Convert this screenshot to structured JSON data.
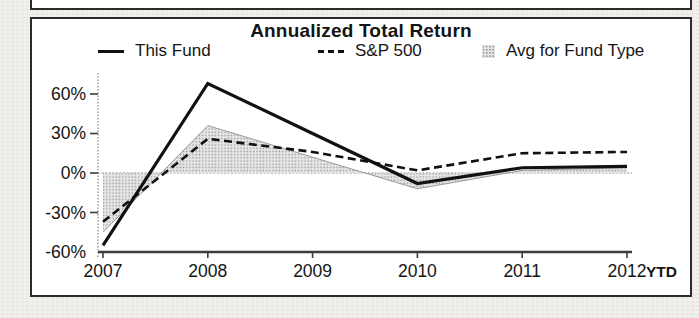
{
  "panel": {
    "title": "Annualized Total Return"
  },
  "legend": {
    "items": [
      {
        "label": "This Fund",
        "swatch": "solid-line"
      },
      {
        "label": "S&P 500",
        "swatch": "dashed-line"
      },
      {
        "label": "Avg for Fund Type",
        "swatch": "shaded-area"
      }
    ]
  },
  "chart_data": {
    "type": "line",
    "title": "Annualized Total Return",
    "categories": [
      "2007",
      "2008",
      "2009",
      "2010",
      "2011",
      "2012"
    ],
    "ytd_label": "YTD",
    "unit": "%",
    "ylim": [
      -60,
      72
    ],
    "y_ticks": [
      {
        "label": "60%",
        "value": 60
      },
      {
        "label": "30%",
        "value": 30
      },
      {
        "label": "0%",
        "value": 0
      },
      {
        "label": "-30%",
        "value": -30
      },
      {
        "label": "-60%",
        "value": -60
      }
    ],
    "grid": "zero-line-only",
    "legend_position": "top",
    "series": [
      {
        "name": "This Fund",
        "type": "line",
        "style": "solid",
        "color": "#111111",
        "values": [
          -55,
          68,
          30,
          -8,
          4,
          5
        ]
      },
      {
        "name": "S&P 500",
        "type": "line",
        "style": "dashed",
        "color": "#111111",
        "values": [
          -37,
          26,
          16,
          2,
          15,
          16
        ]
      },
      {
        "name": "Avg for Fund Type",
        "type": "area",
        "style": "area",
        "fill_color": "#e6e6e6",
        "dot_color": "#9a9a9a",
        "edge_color": "#9a9a9a",
        "values": [
          -45,
          36,
          12,
          -12,
          2,
          4
        ]
      }
    ]
  }
}
